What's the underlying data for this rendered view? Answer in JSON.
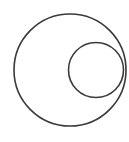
{
  "diagram": {
    "type": "nested-circles",
    "background": "#ffffff",
    "stroke_color": "#3a3a3a",
    "stroke_width": 1.6,
    "shapes": [
      {
        "name": "outer-circle",
        "cx": 70,
        "cy": 70,
        "r": 56
      },
      {
        "name": "inner-circle",
        "cx": 96,
        "cy": 70,
        "r": 27.5
      }
    ],
    "relation": "inner circle internally tangent to outer circle on the right side"
  }
}
